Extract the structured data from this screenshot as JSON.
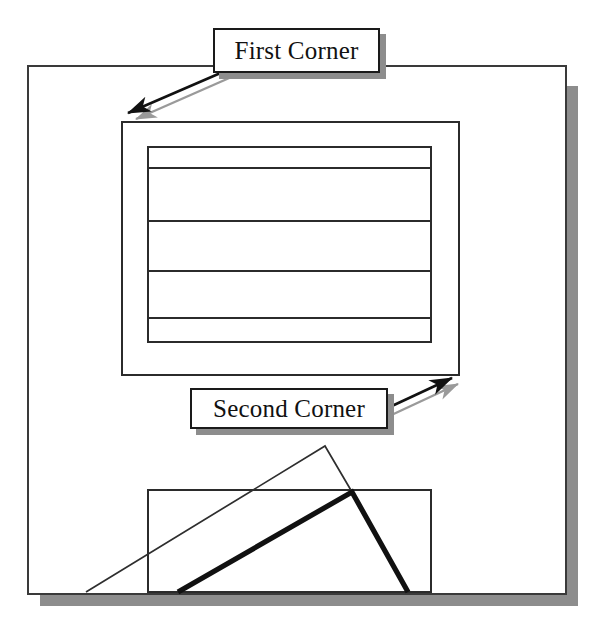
{
  "figure": {
    "kind": "technical-illustration",
    "background_color": "#ffffff",
    "ink_color": "#1a1a1a",
    "shadow_color": "#8d8d8d",
    "paper_tint": "#fbfbfb"
  },
  "callouts": [
    {
      "id": "first-corner",
      "label": "First Corner",
      "box": {
        "x": 213,
        "y": 28,
        "w": 167,
        "h": 45
      },
      "shadow_offset": 6,
      "font_size": 25,
      "pointer": {
        "from_x": 246,
        "from_y": 62,
        "to_x": 128,
        "to_y": 113,
        "style": "solid-arrow-with-shadow"
      }
    },
    {
      "id": "second-corner",
      "label": "Second Corner",
      "box": {
        "x": 190,
        "y": 388,
        "w": 198,
        "h": 41
      },
      "shadow_offset": 6,
      "font_size": 25,
      "pointer": {
        "from_x": 379,
        "from_y": 412,
        "to_x": 452,
        "to_y": 378,
        "style": "solid-arrow-with-shadow"
      }
    }
  ],
  "outer_frame": {
    "name": "drawing-area-border",
    "x": 28,
    "y": 66,
    "w": 538,
    "h": 528,
    "stroke_width": 2,
    "shadow_offset": 12
  },
  "upper_shape": {
    "name": "nested-rectangle-stack",
    "outer_rect": {
      "x": 122,
      "y": 122,
      "w": 337,
      "h": 253
    },
    "inner_rect": {
      "x": 148,
      "y": 147,
      "w": 283,
      "h": 195
    },
    "divider_lines_y": [
      168,
      221,
      271,
      318
    ],
    "stroke_width": 2
  },
  "lower_shape": {
    "name": "rubber-band-rectangle-preview",
    "rect": {
      "x": 148,
      "y": 490,
      "w": 283,
      "h": 102
    },
    "stroke_width": 2,
    "thin_tent": {
      "name": "previous-rubber-band",
      "left_x": 86,
      "left_y": 592,
      "apex_x": 325,
      "apex_y": 446,
      "right_x": 352,
      "right_y": 492,
      "stroke_width": 1.6
    },
    "thick_tent": {
      "name": "current-rubber-band",
      "left_x": 178,
      "left_y": 592,
      "apex_x": 352,
      "apex_y": 492,
      "right_x": 408,
      "right_y": 592,
      "stroke_width": 5
    }
  },
  "ground_shadow": {
    "name": "base-shadow-bar",
    "x": 40,
    "y": 594,
    "w": 538,
    "h": 12
  }
}
